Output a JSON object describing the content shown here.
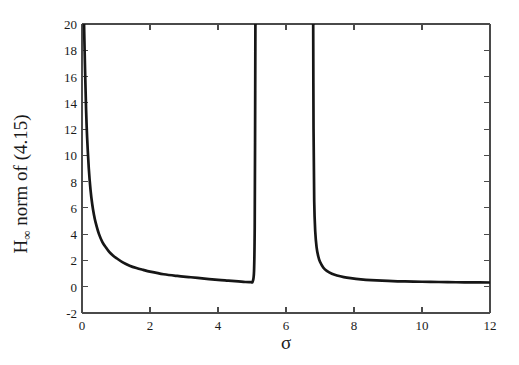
{
  "figure": {
    "background_color": "#ffffff",
    "axis_color": "#4a4a4a",
    "curve_color": "#161616"
  },
  "axes": {
    "x_label": "σ",
    "y_label_main": "H",
    "y_label_sub": "∞",
    "y_label_rest": " norm of (4.15)",
    "y_label_full": "H∞ norm of (4.15)"
  },
  "ticks": {
    "x": [
      "0",
      "2",
      "4",
      "6",
      "8",
      "10",
      "12"
    ],
    "y": [
      "-2",
      "0",
      "2",
      "4",
      "6",
      "8",
      "10",
      "12",
      "14",
      "16",
      "18",
      "20"
    ]
  },
  "chart_data": {
    "type": "line",
    "title": "",
    "xlabel": "σ",
    "ylabel": "H∞ norm of (4.15)",
    "xlim": [
      0,
      12
    ],
    "ylim": [
      -2,
      20
    ],
    "xticks": [
      0,
      2,
      4,
      6,
      8,
      10,
      12
    ],
    "yticks": [
      -2,
      0,
      2,
      4,
      6,
      8,
      10,
      12,
      14,
      16,
      18,
      20
    ],
    "grid": false,
    "legend": null,
    "asymptotes": [
      5.1,
      6.8
    ],
    "annotations": [],
    "series": [
      {
        "name": "branch-1",
        "comment": "left branch: decays from +inf at sigma->0 then blows up at sigma=5.1",
        "x": [
          0.06,
          0.09,
          0.12,
          0.15,
          0.2,
          0.25,
          0.3,
          0.35,
          0.4,
          0.5,
          0.6,
          0.7,
          0.8,
          0.9,
          1.0,
          1.2,
          1.4,
          1.6,
          1.8,
          2.0,
          2.4,
          2.8,
          3.2,
          3.6,
          4.0,
          4.3,
          4.6,
          4.8,
          4.95,
          5.02,
          5.06,
          5.08,
          5.09,
          5.1
        ],
        "y": [
          20.0,
          16.5,
          13.5,
          11.4,
          9.0,
          7.4,
          6.3,
          5.5,
          4.9,
          4.0,
          3.4,
          3.0,
          2.65,
          2.4,
          2.2,
          1.85,
          1.6,
          1.42,
          1.28,
          1.15,
          0.95,
          0.82,
          0.72,
          0.62,
          0.52,
          0.46,
          0.4,
          0.36,
          0.35,
          0.4,
          1.2,
          4.5,
          11.0,
          20.0
        ]
      },
      {
        "name": "branch-2",
        "comment": "right branch: descends from +inf at sigma=6.8 and flattens near 0.3",
        "x": [
          6.8,
          6.81,
          6.83,
          6.86,
          6.9,
          6.95,
          7.0,
          7.1,
          7.2,
          7.35,
          7.5,
          7.7,
          7.9,
          8.2,
          8.5,
          9.0,
          9.5,
          10.0,
          10.5,
          11.0,
          11.5,
          12.0
        ],
        "y": [
          20.0,
          12.0,
          6.5,
          4.2,
          3.0,
          2.3,
          1.9,
          1.45,
          1.2,
          0.98,
          0.85,
          0.73,
          0.65,
          0.56,
          0.5,
          0.44,
          0.4,
          0.38,
          0.36,
          0.34,
          0.33,
          0.32
        ]
      }
    ]
  }
}
